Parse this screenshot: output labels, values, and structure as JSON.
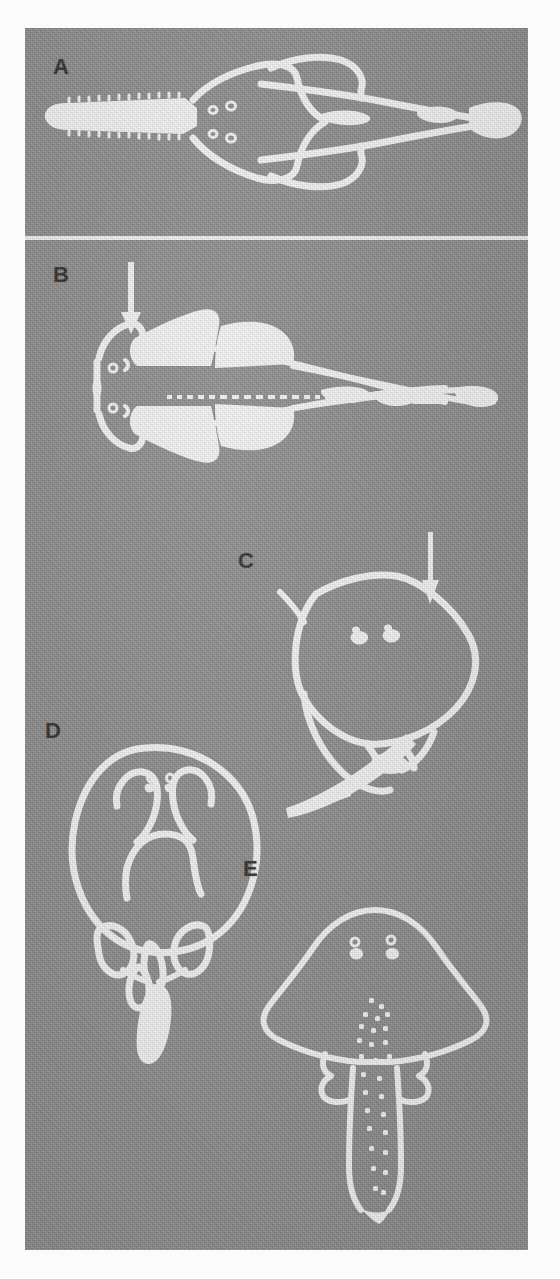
{
  "figure": {
    "type": "scientific-plate",
    "background_color": "#8d8d8d",
    "ink_color": "#f7f7f7",
    "label_color": "#2c2c2c",
    "panel_count": 5,
    "caption": ""
  },
  "panels": [
    {
      "id": "A",
      "label": "A",
      "subject": "sawfish-dorsal-outline",
      "description": "Elongate batoid in dorsal view with a long toothed rostrum (saw), triangular disc, two dorsal fins and a caudal fin",
      "features": [
        "toothed-rostrum",
        "eyes",
        "spiracles",
        "pectoral-fins",
        "pelvic-fins",
        "first-dorsal-fin",
        "second-dorsal-fin",
        "caudal-fin"
      ],
      "arrow": false
    },
    {
      "id": "B",
      "label": "B",
      "subject": "guitarfish-dorsal-outline",
      "description": "Shovelnose ray in dorsal view with filled pectoral and pelvic fins, median row of denticles along the back, two dorsal fins and caudal fin",
      "features": [
        "rounded-snout",
        "eyes",
        "spiracles",
        "pectoral-fins",
        "pelvic-fins",
        "median-denticle-row",
        "first-dorsal-fin",
        "second-dorsal-fin",
        "caudal-fin"
      ],
      "arrow": true,
      "arrow_direction": "down",
      "arrow_target": "anterior-disc-margin"
    },
    {
      "id": "C",
      "label": "C",
      "subject": "electric-ray-dorsal-outline",
      "description": "Rhomboidal disc in dorsal view with eyes and spiracles, pelvic fins and a long curved tail bearing fins",
      "features": [
        "rhomboid-disc",
        "eyes",
        "spiracles",
        "pelvic-fins",
        "dorsal-fins",
        "caudal-fin",
        "tail"
      ],
      "arrow": true,
      "arrow_direction": "down",
      "arrow_target": "right-anterior-disc-margin"
    },
    {
      "id": "D",
      "label": "D",
      "subject": "torpedo-ray-dorsal-outline",
      "description": "Nearly circular disc in dorsal view showing paired electric organs, eyes and spiracles, pelvic fins and a short stout tail",
      "features": [
        "circular-disc",
        "electric-organs",
        "eyes",
        "spiracles",
        "mouth-arch",
        "pelvic-fins",
        "dorsal-fins",
        "caudal-fin"
      ],
      "arrow": false
    },
    {
      "id": "E",
      "label": "E",
      "subject": "skate-dorsal-outline",
      "description": "Rhomboid-disc skate in dorsal view with eyes and spiracles, pelvic fins and a long slender tail bearing rows of thorns",
      "features": [
        "rhomboid-disc",
        "eyes",
        "spiracles",
        "pelvic-fins",
        "median-thorn-rows",
        "long-tail",
        "tail-folds"
      ],
      "arrow": false
    }
  ]
}
